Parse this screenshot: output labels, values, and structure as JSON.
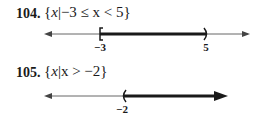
{
  "problems": [
    {
      "number": "104.",
      "set_notation": "{x|−3 ≤ x < 5}",
      "open": "{",
      "var": "x",
      "bar": "|",
      "condition": "−3 ≤ x < 5",
      "close": "}",
      "number_line": {
        "left_label": "−3",
        "right_label": "5",
        "left_endpoint": "closed-bracket",
        "right_endpoint": "open-paren",
        "interval": "[-3, 5)"
      }
    },
    {
      "number": "105.",
      "set_notation": "{x|x > −2}",
      "open": "{",
      "var": "x",
      "bar": "|",
      "condition": "x > −2",
      "close": "}",
      "number_line": {
        "left_label": "−2",
        "left_endpoint": "open-paren",
        "interval": "(-2, ∞)"
      }
    }
  ]
}
